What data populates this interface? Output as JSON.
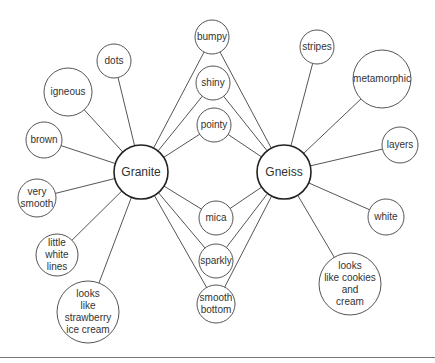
{
  "diagram": {
    "type": "double-bubble-map",
    "colors": {
      "stroke": "#555555",
      "hub_stroke": "#222222",
      "text": "#333333",
      "background": "#ffffff"
    },
    "hubs": [
      {
        "id": "granite",
        "label": "Granite",
        "x": 141,
        "y": 172,
        "r": 27
      },
      {
        "id": "gneiss",
        "label": "Gneiss",
        "x": 284,
        "y": 172,
        "r": 27
      }
    ],
    "granite_only": [
      {
        "id": "dots",
        "label": "dots",
        "x": 114,
        "y": 61,
        "r": 17
      },
      {
        "id": "igneous",
        "label": "igneous",
        "x": 68,
        "y": 92,
        "r": 24
      },
      {
        "id": "brown",
        "label": "brown",
        "x": 44,
        "y": 140,
        "r": 18
      },
      {
        "id": "very-smooth",
        "label": "very\nsmooth",
        "x": 37,
        "y": 198,
        "r": 19
      },
      {
        "id": "little-white-lines",
        "label": "little\nwhite\nlines",
        "x": 57,
        "y": 255,
        "r": 21
      },
      {
        "id": "strawberry",
        "label": "looks\nlike\nstrawberry\nice cream",
        "x": 88,
        "y": 312,
        "r": 31
      }
    ],
    "shared": [
      {
        "id": "bumpy",
        "label": "bumpy",
        "x": 212,
        "y": 37,
        "r": 17
      },
      {
        "id": "shiny",
        "label": "shiny",
        "x": 213,
        "y": 83,
        "r": 17
      },
      {
        "id": "pointy",
        "label": "pointy",
        "x": 214,
        "y": 125,
        "r": 17
      },
      {
        "id": "mica",
        "label": "mica",
        "x": 216,
        "y": 218,
        "r": 17
      },
      {
        "id": "sparkly",
        "label": "sparkly",
        "x": 216,
        "y": 261,
        "r": 17
      },
      {
        "id": "smooth-bottom",
        "label": "smooth\nbottom",
        "x": 216,
        "y": 304,
        "r": 19
      }
    ],
    "gneiss_only": [
      {
        "id": "stripes",
        "label": "stripes",
        "x": 317,
        "y": 47,
        "r": 17
      },
      {
        "id": "metamorphic",
        "label": "metamorphic",
        "x": 382,
        "y": 79,
        "r": 29
      },
      {
        "id": "layers",
        "label": "layers",
        "x": 400,
        "y": 145,
        "r": 18
      },
      {
        "id": "white",
        "label": "white",
        "x": 386,
        "y": 217,
        "r": 18
      },
      {
        "id": "cookies-cream",
        "label": "looks\nlike cookies\nand\ncream",
        "x": 350,
        "y": 284,
        "r": 31
      }
    ]
  }
}
